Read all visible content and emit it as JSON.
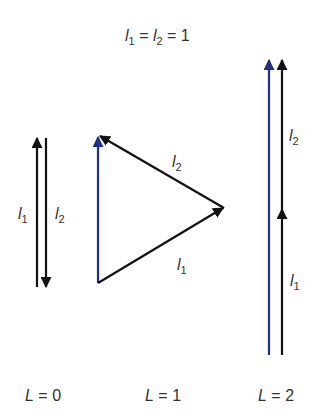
{
  "title": {
    "l1": "l",
    "l1_sub": "1",
    "eq1": " = ",
    "l2": "l",
    "l2_sub": "2",
    "eq2": " = 1"
  },
  "panels": [
    {
      "name": "L=0",
      "label_var": "L",
      "label_rest": " = 0",
      "vectors": [
        {
          "name": "l1",
          "letter": "l",
          "sub": "1",
          "color": "#111111",
          "direction": "up"
        },
        {
          "name": "l2",
          "letter": "l",
          "sub": "2",
          "color": "#111111",
          "direction": "down"
        }
      ]
    },
    {
      "name": "L=1",
      "label_var": "L",
      "label_rest": " = 1",
      "vectors": [
        {
          "name": "l1",
          "letter": "l",
          "sub": "1",
          "color": "#111111"
        },
        {
          "name": "l2",
          "letter": "l",
          "sub": "2",
          "color": "#111111"
        },
        {
          "name": "L",
          "color": "#1f2f8f"
        }
      ]
    },
    {
      "name": "L=2",
      "label_var": "L",
      "label_rest": " = 2",
      "vectors": [
        {
          "name": "l1",
          "letter": "l",
          "sub": "1",
          "color": "#111111"
        },
        {
          "name": "l2",
          "letter": "l",
          "sub": "2",
          "color": "#111111"
        },
        {
          "name": "L",
          "color": "#1f2f8f"
        }
      ]
    }
  ],
  "colors": {
    "resultant": "#1f2f8f",
    "component": "#111111"
  }
}
